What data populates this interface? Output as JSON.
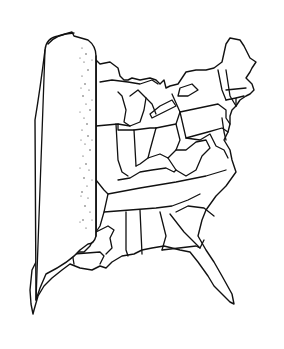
{
  "illustration": {
    "subject": "Map of the eastern United States with the western half rolled up like a scroll",
    "style": "black line drawing on white",
    "colors": {
      "background": "#ffffff",
      "ink": "#111111"
    },
    "elements": [
      "rolled-scroll",
      "state-borders",
      "atlantic-coastline",
      "gulf-coastline",
      "great-lakes",
      "florida-peninsula"
    ]
  }
}
